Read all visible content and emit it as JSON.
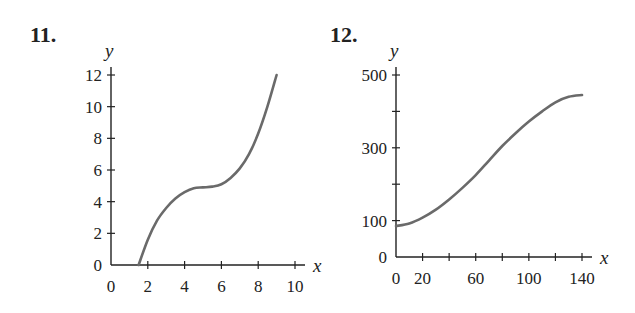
{
  "problems": [
    {
      "number": "11."
    },
    {
      "number": "12."
    }
  ],
  "chart_data": [
    {
      "type": "line",
      "title": "11.",
      "xlabel": "x",
      "ylabel": "y",
      "xlim": [
        0,
        10
      ],
      "ylim": [
        0,
        12
      ],
      "xticks": [
        0,
        2,
        4,
        6,
        8,
        10
      ],
      "yticks": [
        0,
        2,
        4,
        6,
        8,
        10,
        12
      ],
      "grid": false,
      "x": [
        1.5,
        2,
        2.5,
        3,
        3.5,
        4,
        4.5,
        5,
        5.5,
        6,
        6.5,
        7,
        7.5,
        8,
        8.5,
        9
      ],
      "y": [
        0,
        1.6,
        2.8,
        3.6,
        4.2,
        4.6,
        4.85,
        4.9,
        4.95,
        5.1,
        5.5,
        6.1,
        7.0,
        8.3,
        10.0,
        12.0
      ]
    },
    {
      "type": "line",
      "title": "12.",
      "xlabel": "x",
      "ylabel": "y",
      "xlim": [
        0,
        140
      ],
      "ylim": [
        0,
        500
      ],
      "xticks": [
        0,
        20,
        60,
        100,
        140
      ],
      "xticks_minor_every": 20,
      "yticks": [
        0,
        100,
        300,
        500
      ],
      "yticks_minor_every": 100,
      "grid": false,
      "x": [
        0,
        10,
        20,
        30,
        40,
        50,
        60,
        70,
        80,
        90,
        100,
        110,
        120,
        130,
        140
      ],
      "y": [
        85,
        92,
        108,
        130,
        158,
        190,
        225,
        265,
        305,
        340,
        372,
        400,
        425,
        440,
        445
      ]
    }
  ]
}
